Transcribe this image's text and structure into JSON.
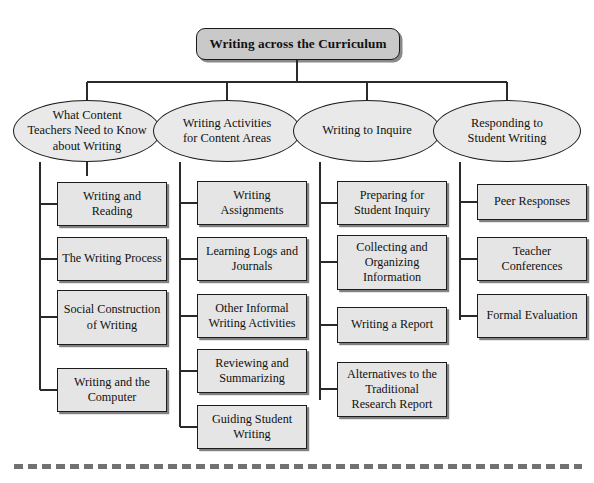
{
  "diagram": {
    "root": {
      "label": "Writing across the Curriculum"
    },
    "branches": [
      {
        "label": "What Content Teachers Need to Know about Writing",
        "line1": "What Content",
        "line2": "Teachers Need to Know",
        "line3": "about Writing",
        "leaves": [
          {
            "label": "Writing and Reading",
            "line1": "Writing",
            "line2": "and Reading"
          },
          {
            "label": "The Writing Process",
            "line1": "The Writing",
            "line2": "Process"
          },
          {
            "label": "Social Construction of Writing",
            "line1": "Social",
            "line2": "Construction",
            "line3": "of Writing"
          },
          {
            "label": "Writing and the Computer",
            "line1": "Writing and the",
            "line2": "Computer"
          }
        ]
      },
      {
        "label": "Writing Activities for Content Areas",
        "line1": "Writing Activities",
        "line2": "for Content Areas",
        "line3": "",
        "leaves": [
          {
            "label": "Writing Assignments",
            "line1": "Writing",
            "line2": "Assignments"
          },
          {
            "label": "Learning Logs and Journals",
            "line1": "Learning Logs",
            "line2": "and Journals"
          },
          {
            "label": "Other Informal Writing Activities",
            "line1": "Other Informal",
            "line2": "Writing Activities"
          },
          {
            "label": "Reviewing and Summarizing",
            "line1": "Reviewing and",
            "line2": "Summarizing"
          },
          {
            "label": "Guiding Student Writing",
            "line1": "Guiding Student",
            "line2": "Writing"
          }
        ]
      },
      {
        "label": "Writing to Inquire",
        "line1": "Writing to Inquire",
        "line2": "",
        "line3": "",
        "leaves": [
          {
            "label": "Preparing for Student Inquiry",
            "line1": "Preparing for",
            "line2": "Student Inquiry"
          },
          {
            "label": "Collecting and Organizing Information",
            "line1": "Collecting and",
            "line2": "Organizing",
            "line3": "Information"
          },
          {
            "label": "Writing a Report",
            "line1": "Writing a Report",
            "line2": ""
          },
          {
            "label": "Alternatives to the Traditional Research Report",
            "line1": "Alternatives",
            "line2": "to the Traditional",
            "line3": "Research Report"
          }
        ]
      },
      {
        "label": "Responding to Student Writing",
        "line1": "Responding to",
        "line2": "Student Writing",
        "line3": "",
        "leaves": [
          {
            "label": "Peer Responses",
            "line1": "Peer Responses",
            "line2": ""
          },
          {
            "label": "Teacher Conferences",
            "line1": "Teacher",
            "line2": "Conferences"
          },
          {
            "label": "Formal Evaluation",
            "line1": "Formal",
            "line2": "Evaluation"
          }
        ]
      }
    ]
  },
  "colors": {
    "root_fill": "#c9c9c9",
    "branch_fill": "#e9e9e9",
    "leaf_fill": "#e5e5e5",
    "stroke": "#1a1a1a",
    "background": "#ffffff"
  }
}
